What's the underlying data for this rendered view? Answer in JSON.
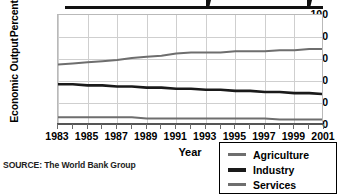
{
  "chart_data": {
    "type": "line",
    "title": "",
    "xlabel": "Year",
    "ylabel": "Percent of Annual Economic Output",
    "ylabel_line1": "Percent of Annual",
    "ylabel_line2": "Economic Output",
    "ylim": [
      0,
      100
    ],
    "yticks": [
      0,
      20,
      40,
      60,
      80,
      100
    ],
    "xlim": [
      1983,
      2001
    ],
    "x": [
      1983,
      1984,
      1985,
      1986,
      1987,
      1988,
      1989,
      1990,
      1991,
      1992,
      1993,
      1994,
      1995,
      1996,
      1997,
      1998,
      1999,
      2000,
      2001
    ],
    "xtick_labels": [
      "1983",
      "1985",
      "1987",
      "1989",
      "1991",
      "1993",
      "1995",
      "1997",
      "1999",
      "2001"
    ],
    "xticks": [
      1983,
      1985,
      1987,
      1989,
      1991,
      1993,
      1995,
      1997,
      1999,
      2001
    ],
    "grid": true,
    "legend_position": "bottom-right",
    "series": [
      {
        "name": "Agriculture",
        "color": "#6e6e6e",
        "values": [
          7,
          7,
          7,
          7,
          7,
          7,
          6,
          6,
          6,
          6,
          6,
          6,
          6,
          6,
          6,
          5,
          5,
          5,
          5
        ]
      },
      {
        "name": "Industry",
        "color": "#1a1a1a",
        "values": [
          37,
          37,
          36,
          36,
          35,
          35,
          34,
          34,
          33,
          33,
          32,
          32,
          31,
          31,
          30,
          30,
          29,
          29,
          28
        ]
      },
      {
        "name": "Services",
        "color": "#6e6e6e",
        "values": [
          55,
          56,
          57,
          58,
          59,
          61,
          62,
          63,
          65,
          66,
          66,
          66,
          67,
          67,
          67,
          68,
          68,
          69,
          69
        ]
      }
    ]
  },
  "source": {
    "text": "SOURCE: The World Bank Group"
  },
  "legend": {
    "items": [
      {
        "label": "Agriculture",
        "color": "#6e6e6e",
        "weight": "thin"
      },
      {
        "label": "Industry",
        "color": "#1a1a1a",
        "weight": "thick"
      },
      {
        "label": "Services",
        "color": "#6e6e6e",
        "weight": "thin"
      }
    ]
  }
}
